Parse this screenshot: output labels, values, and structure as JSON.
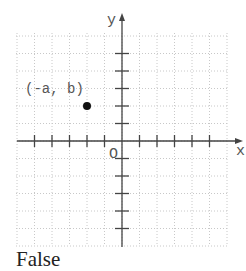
{
  "diagram": {
    "type": "coordinate-plane",
    "x_axis_label": "x",
    "y_axis_label": "y",
    "origin_label": "O",
    "tick_spacing_px": 17.5,
    "x_ticks": [
      -5,
      -4,
      -3,
      -2,
      -1,
      1,
      2,
      3,
      4,
      5
    ],
    "y_ticks": [
      5,
      4,
      3,
      2,
      1,
      -1,
      -2,
      -3,
      -4,
      -5
    ],
    "grid": "dotted",
    "point": {
      "label": "(-a, b)",
      "x": -2,
      "y": 2
    },
    "colors": {
      "axis": "#444444",
      "grid": "#c8c8c8",
      "point": "#111111",
      "text": "#555555"
    }
  },
  "answer": {
    "text": "False"
  }
}
